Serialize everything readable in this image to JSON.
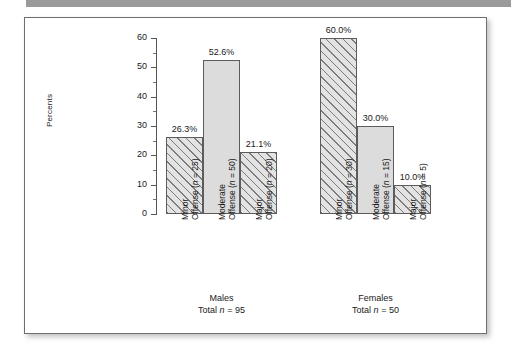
{
  "figure": {
    "header_band_color": "#9a9a9a",
    "panel_border_color": "#6e6e6e",
    "hatch_line_color": "#7d7d7d",
    "solid_fill_color": "#dcdcdc",
    "hatched_fill_color": "#e3e3e3"
  },
  "chart_data": {
    "type": "bar",
    "title": "",
    "xlabel": "",
    "ylabel": "Percents",
    "ylim": [
      0,
      60
    ],
    "yticks": [
      0,
      10,
      20,
      30,
      40,
      50,
      60
    ],
    "ytick_labels": [
      "0",
      "10",
      "20",
      "30",
      "40",
      "50",
      "60"
    ],
    "grid": false,
    "legend": null,
    "groups": [
      {
        "name": "Males",
        "caption_line1": "Males",
        "caption_line2_prefix": "Total ",
        "caption_line2_italic": "n",
        "caption_line2_suffix": " = 95",
        "total_n": 95,
        "categories": [
          {
            "label_line1": "Minor",
            "label_line2_prefix": "Offense (",
            "label_line2_italic": "n",
            "label_line2_suffix": " = 25)",
            "n": 25,
            "value": 26.3,
            "value_label": "26.3%",
            "fill": "hatched"
          },
          {
            "label_line1": "Moderate",
            "label_line2_prefix": "Offense (",
            "label_line2_italic": "n",
            "label_line2_suffix": " = 50)",
            "n": 50,
            "value": 52.6,
            "value_label": "52.6%",
            "fill": "solid"
          },
          {
            "label_line1": "Major",
            "label_line2_prefix": "Offense (",
            "label_line2_italic": "n",
            "label_line2_suffix": " = 20)",
            "n": 20,
            "value": 21.1,
            "value_label": "21.1%",
            "fill": "hatched"
          }
        ]
      },
      {
        "name": "Females",
        "caption_line1": "Females",
        "caption_line2_prefix": "Total ",
        "caption_line2_italic": "n",
        "caption_line2_suffix": " = 50",
        "total_n": 50,
        "categories": [
          {
            "label_line1": "Minor",
            "label_line2_prefix": "Offense (",
            "label_line2_italic": "n",
            "label_line2_suffix": " = 30)",
            "n": 30,
            "value": 60.0,
            "value_label": "60.0%",
            "fill": "hatched"
          },
          {
            "label_line1": "Moderate",
            "label_line2_prefix": "Offense (",
            "label_line2_italic": "n",
            "label_line2_suffix": " = 15)",
            "n": 15,
            "value": 30.0,
            "value_label": "30.0%",
            "fill": "solid"
          },
          {
            "label_line1": "Major",
            "label_line2_prefix": "Offense (",
            "label_line2_italic": "n",
            "label_line2_suffix": " = 5)",
            "n": 5,
            "value": 10.0,
            "value_label": "10.0%",
            "fill": "hatched"
          }
        ]
      }
    ]
  }
}
